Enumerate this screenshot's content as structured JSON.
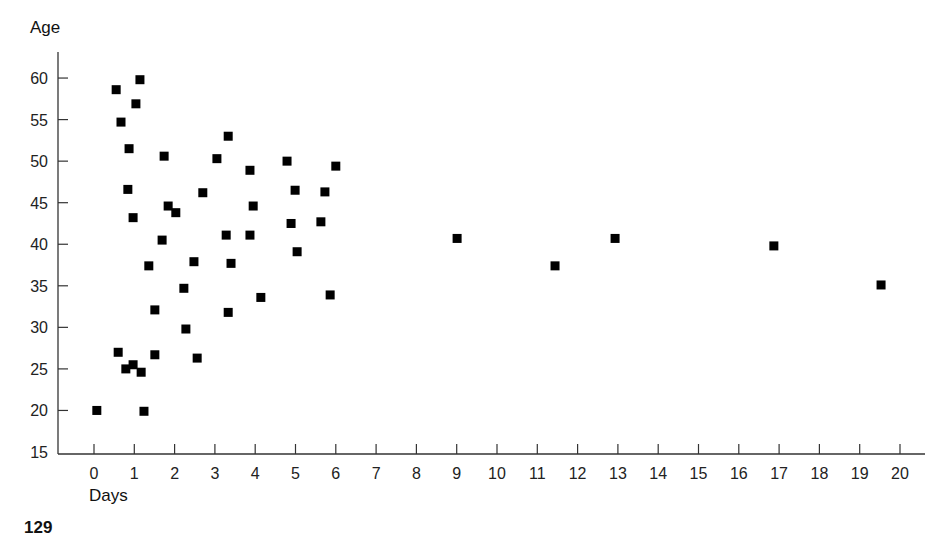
{
  "page": {
    "title_partial": "",
    "page_number": "129"
  },
  "chart_data": {
    "type": "scatter",
    "title": "",
    "xlabel": "Days",
    "ylabel": "Age",
    "xlim": [
      -0.9,
      20.8
    ],
    "ylim": [
      15,
      62
    ],
    "xticks": [
      0,
      1,
      2,
      3,
      4,
      5,
      6,
      7,
      8,
      9,
      10,
      11,
      12,
      13,
      14,
      15,
      16,
      17,
      18,
      19,
      20
    ],
    "yticks": [
      15,
      20,
      25,
      30,
      35,
      40,
      45,
      50,
      55,
      60
    ],
    "grid": false,
    "legend": null,
    "marker": "square",
    "marker_color": "#000000",
    "points": [
      {
        "x": 1.14,
        "y": 59.8
      },
      {
        "x": 0.55,
        "y": 58.6
      },
      {
        "x": 1.04,
        "y": 56.9
      },
      {
        "x": 0.67,
        "y": 54.7
      },
      {
        "x": 0.87,
        "y": 51.5
      },
      {
        "x": 1.74,
        "y": 50.6
      },
      {
        "x": 0.84,
        "y": 46.6
      },
      {
        "x": 0.97,
        "y": 43.2
      },
      {
        "x": 1.84,
        "y": 44.6
      },
      {
        "x": 2.03,
        "y": 43.8
      },
      {
        "x": 1.69,
        "y": 40.5
      },
      {
        "x": 1.36,
        "y": 37.4
      },
      {
        "x": 1.51,
        "y": 32.1
      },
      {
        "x": 0.6,
        "y": 27.0
      },
      {
        "x": 1.51,
        "y": 26.7
      },
      {
        "x": 0.79,
        "y": 25.0
      },
      {
        "x": 0.97,
        "y": 25.5
      },
      {
        "x": 1.17,
        "y": 24.6
      },
      {
        "x": 0.07,
        "y": 20.0
      },
      {
        "x": 1.24,
        "y": 19.9
      },
      {
        "x": 3.33,
        "y": 53.0
      },
      {
        "x": 3.05,
        "y": 50.3
      },
      {
        "x": 3.87,
        "y": 48.9
      },
      {
        "x": 4.79,
        "y": 50.0
      },
      {
        "x": 6.0,
        "y": 49.4
      },
      {
        "x": 2.7,
        "y": 46.2
      },
      {
        "x": 4.99,
        "y": 46.5
      },
      {
        "x": 5.73,
        "y": 46.3
      },
      {
        "x": 3.95,
        "y": 44.6
      },
      {
        "x": 2.48,
        "y": 37.9
      },
      {
        "x": 3.4,
        "y": 37.7
      },
      {
        "x": 3.28,
        "y": 41.1
      },
      {
        "x": 3.87,
        "y": 41.1
      },
      {
        "x": 4.89,
        "y": 42.5
      },
      {
        "x": 5.63,
        "y": 42.7
      },
      {
        "x": 5.04,
        "y": 39.1
      },
      {
        "x": 2.23,
        "y": 34.7
      },
      {
        "x": 4.14,
        "y": 33.6
      },
      {
        "x": 5.86,
        "y": 33.9
      },
      {
        "x": 2.28,
        "y": 29.8
      },
      {
        "x": 3.33,
        "y": 31.8
      },
      {
        "x": 2.56,
        "y": 26.3
      },
      {
        "x": 9.01,
        "y": 40.7
      },
      {
        "x": 11.44,
        "y": 37.4
      },
      {
        "x": 12.93,
        "y": 40.7
      },
      {
        "x": 16.87,
        "y": 39.8
      },
      {
        "x": 19.53,
        "y": 35.1
      }
    ]
  }
}
